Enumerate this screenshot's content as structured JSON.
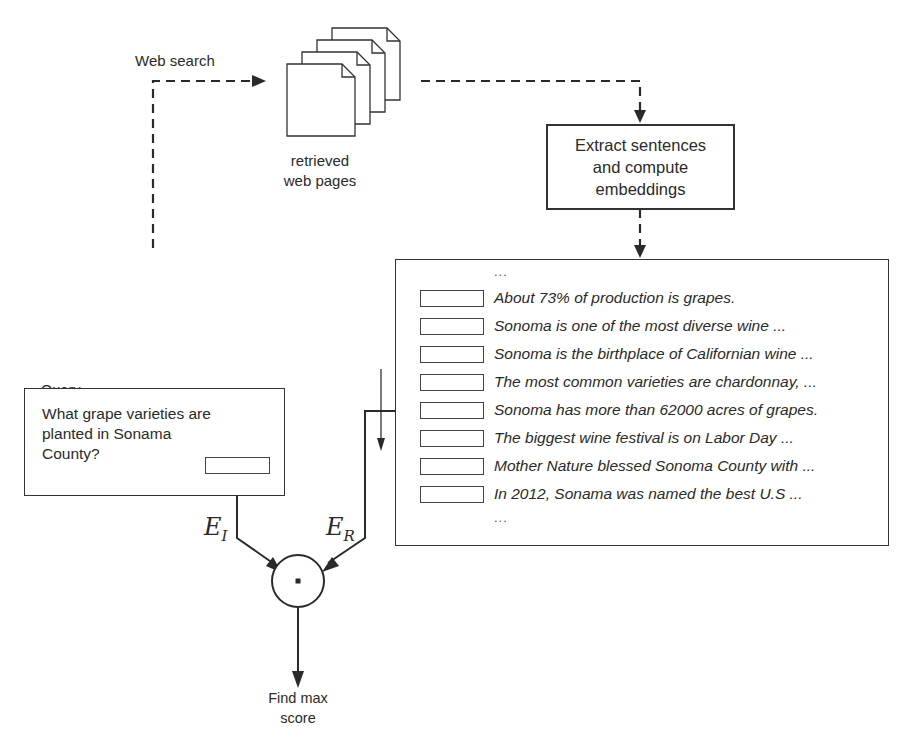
{
  "labels": {
    "web_search": "Web search",
    "retrieved_pages_line1": "retrieved",
    "retrieved_pages_line2": "web pages",
    "query_title": "Query",
    "find_max_line1": "Find max",
    "find_max_line2": "score"
  },
  "extract_box": {
    "line1": "Extract sentences",
    "line2": "and compute",
    "line3": "embeddings"
  },
  "query_box": {
    "line1": "What grape varieties are",
    "line2": "planted in Sonama",
    "line3": "County?"
  },
  "sentences": {
    "top_ellipsis": "...",
    "items": [
      "About 73% of production is grapes.",
      "Sonoma is one of the most diverse wine ...",
      "Sonoma is the birthplace of Californian wine ...",
      "The most common varieties are chardonnay, ...",
      "Sonoma has more than 62000 acres of grapes.",
      "The biggest wine festival is on Labor Day ...",
      "Mother Nature blessed Sonoma County with ...",
      "In 2012, Sonama was named the best U.S ..."
    ],
    "bottom_ellipsis": "..."
  },
  "math": {
    "e_image": "E",
    "e_image_sub": "I",
    "e_retrieved": "E",
    "e_retrieved_sub": "R",
    "dot_operator": "·"
  },
  "colors": {
    "line": "#333333",
    "text": "#2a2a2a",
    "background": "#ffffff"
  }
}
